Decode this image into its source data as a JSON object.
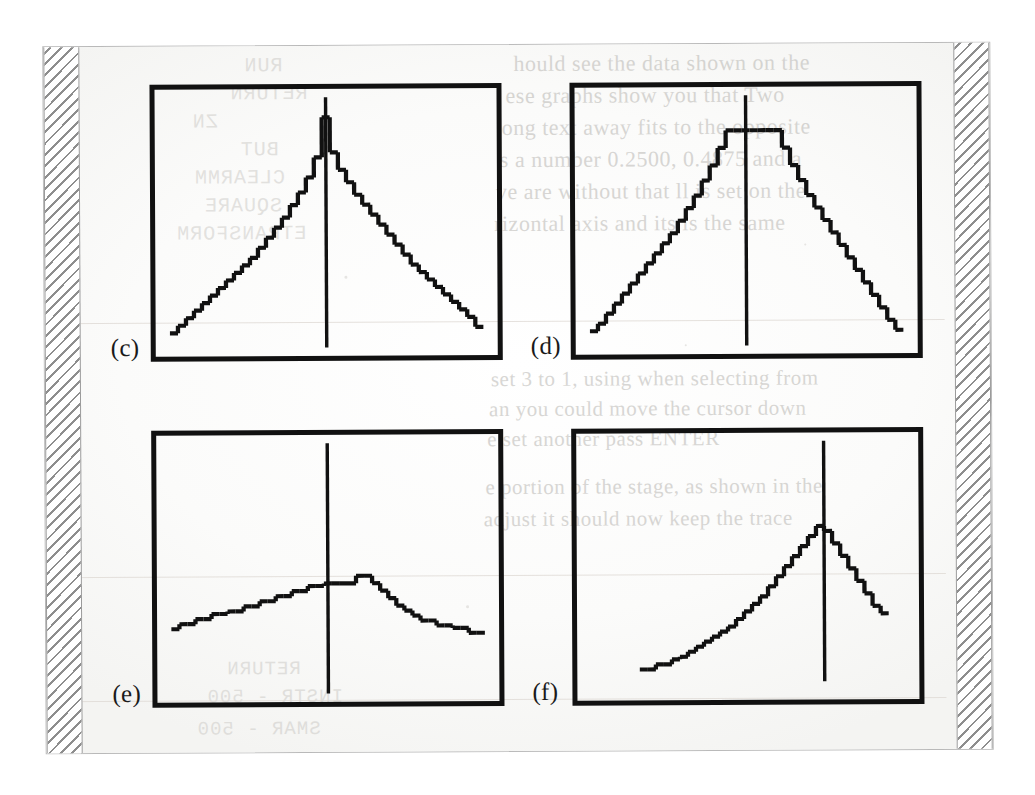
{
  "document": {
    "kind": "scanned-page",
    "description": "Photocopied book page showing four plot panels with pixelated staircase curves and vertical reference lines",
    "page_background": "#fcfcfc",
    "ink_color": "#111111",
    "hatch_color": "#8e8e8e",
    "ghost_color": "#b9b7b3"
  },
  "panels": [
    {
      "id": "c",
      "label": "(c)",
      "shape": "sharp symmetric triangular peak",
      "marker_x_pct": 50
    },
    {
      "id": "d",
      "label": "(d)",
      "shape": "flat-topped trapezoid / plateau",
      "marker_x_pct": 50
    },
    {
      "id": "e",
      "label": "(e)",
      "shape": "low broad rounded hump",
      "marker_x_pct": 50
    },
    {
      "id": "f",
      "label": "(f)",
      "shape": "right-shifted asymmetric peak with steep fall",
      "marker_x_pct": 74
    }
  ],
  "chart_data": [
    {
      "type": "line",
      "id": "c",
      "title": "(c)",
      "xlabel": "",
      "ylabel": "",
      "grid": false,
      "legend": "none",
      "xlim": [
        0,
        40
      ],
      "ylim": [
        0,
        100
      ],
      "marker_line_x": 20,
      "marker_line_from_y": 0,
      "marker_line_to_y": 100,
      "x": [
        1,
        2,
        3,
        4,
        5,
        6,
        7,
        8,
        9,
        10,
        11,
        12,
        13,
        14,
        15,
        16,
        17,
        18,
        19,
        20,
        21,
        22,
        23,
        24,
        25,
        26,
        27,
        28,
        29,
        30,
        31,
        32,
        33,
        34,
        35,
        36,
        37,
        38,
        39
      ],
      "values": [
        6,
        9,
        12,
        15,
        18,
        21,
        24,
        27,
        30,
        33,
        36,
        40,
        44,
        48,
        52,
        57,
        62,
        68,
        76,
        92,
        78,
        71,
        66,
        61,
        57,
        53,
        49,
        45,
        41,
        37,
        33,
        30,
        27,
        24,
        21,
        18,
        15,
        12,
        8
      ]
    },
    {
      "type": "line",
      "id": "d",
      "title": "(d)",
      "xlabel": "",
      "ylabel": "",
      "grid": false,
      "legend": "none",
      "xlim": [
        0,
        40
      ],
      "ylim": [
        0,
        100
      ],
      "marker_line_x": 20,
      "marker_line_from_y": 0,
      "marker_line_to_y": 100,
      "x": [
        1,
        2,
        3,
        4,
        5,
        6,
        7,
        8,
        9,
        10,
        11,
        12,
        13,
        14,
        15,
        16,
        17,
        18,
        19,
        20,
        21,
        22,
        23,
        24,
        25,
        26,
        27,
        28,
        29,
        30,
        31,
        32,
        33,
        34,
        35,
        36,
        37,
        38,
        39
      ],
      "values": [
        6,
        9,
        13,
        17,
        21,
        25,
        29,
        33,
        37,
        41,
        45,
        50,
        55,
        60,
        66,
        72,
        79,
        86,
        86,
        86,
        86,
        86,
        86,
        86,
        79,
        72,
        66,
        60,
        55,
        50,
        45,
        40,
        35,
        30,
        25,
        20,
        15,
        10,
        6
      ]
    },
    {
      "type": "line",
      "id": "e",
      "title": "(e)",
      "xlabel": "",
      "ylabel": "",
      "grid": false,
      "legend": "none",
      "xlim": [
        0,
        40
      ],
      "ylim": [
        0,
        100
      ],
      "marker_line_x": 20,
      "marker_line_from_y": 0,
      "marker_line_to_y": 100,
      "x": [
        1,
        2,
        3,
        4,
        5,
        6,
        7,
        8,
        9,
        10,
        11,
        12,
        13,
        14,
        15,
        16,
        17,
        18,
        19,
        20,
        21,
        22,
        23,
        24,
        25,
        26,
        27,
        28,
        29,
        30,
        31,
        32,
        33,
        34,
        35,
        36,
        37,
        38,
        39
      ],
      "values": [
        26,
        28,
        28,
        30,
        30,
        32,
        32,
        33,
        33,
        35,
        35,
        37,
        37,
        39,
        39,
        41,
        41,
        43,
        43,
        44,
        44,
        44,
        44,
        47,
        47,
        44,
        41,
        38,
        35,
        33,
        31,
        29,
        29,
        27,
        27,
        26,
        26,
        24,
        24
      ]
    },
    {
      "type": "line",
      "id": "f",
      "title": "(f)",
      "xlabel": "",
      "ylabel": "",
      "grid": false,
      "legend": "none",
      "xlim": [
        0,
        40
      ],
      "ylim": [
        0,
        100
      ],
      "marker_line_x": 29.5,
      "marker_line_from_y": 4,
      "marker_line_to_y": 100,
      "x": [
        1,
        2,
        3,
        4,
        5,
        6,
        7,
        8,
        9,
        10,
        11,
        12,
        13,
        14,
        15,
        16,
        17,
        18,
        19,
        20,
        21,
        22,
        23,
        24,
        25,
        26,
        27,
        28,
        29,
        30,
        31,
        32,
        33,
        34,
        35,
        36,
        37,
        38,
        39
      ],
      "values": [
        null,
        null,
        null,
        null,
        null,
        null,
        9,
        9,
        11,
        11,
        13,
        14,
        16,
        18,
        20,
        22,
        24,
        26,
        29,
        32,
        35,
        38,
        42,
        46,
        50,
        54,
        58,
        62,
        66,
        64,
        59,
        54,
        49,
        44,
        39,
        34,
        31,
        null,
        null
      ]
    }
  ],
  "ghost_text": {
    "top_right_lines": [
      "hould see the data shown on the",
      "ese graphs show you that  Two",
      "ong text away fits to the opposite",
      "s a number  0.2500, 0.4875 and a",
      "ve are without  that ll is set on the",
      "rizontal axis and its  is the same"
    ],
    "mid_right_lines": [
      "set 3 to 1, using when selecting from",
      "an you could  move the cursor down",
      "e set another pass  ENTER"
    ],
    "lower_right_lines": [
      "e portion of the stage, as shown in the",
      "adjust it should  now keep the trace"
    ],
    "left_column_fragments": [
      "RUN",
      "RETURN",
      "ZN",
      "BUT",
      "CLEARMM",
      "SQUARE",
      "ETRANSFORM"
    ],
    "bottom_fragments": [
      "RETURN",
      "INSTR - 500",
      "SMAR - 500"
    ]
  }
}
